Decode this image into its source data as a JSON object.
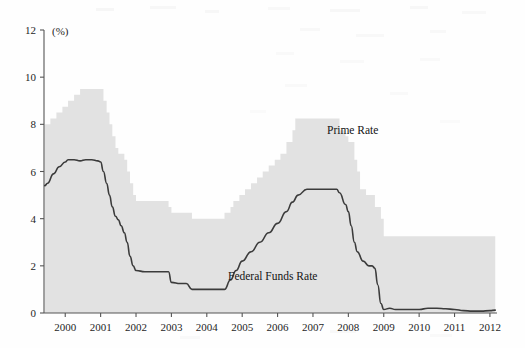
{
  "figure": {
    "background_color": "#fefefe",
    "area_fill_color": "#e2e2e2",
    "line_color": "#3b3b3b",
    "axis_color": "#555555"
  },
  "axes": {
    "y_unit_label": "(%)",
    "y_ticks": [
      "0",
      "2",
      "4",
      "6",
      "8",
      "10",
      "12"
    ],
    "x_ticks": [
      "2000",
      "2001",
      "2002",
      "2003",
      "2004",
      "2005",
      "2006",
      "2007",
      "2008",
      "2009",
      "2010",
      "2011",
      "2012"
    ]
  },
  "annotations": {
    "prime_rate_label": "Prime Rate",
    "federal_funds_label": "Federal Funds Rate"
  },
  "chart_data": {
    "type": "area",
    "title": "",
    "xlabel": "",
    "ylabel": "(%)",
    "ylim": [
      0,
      12
    ],
    "xlim": [
      1999.4,
      2012.2
    ],
    "grid": false,
    "legend": "inline annotations",
    "x_tick_values": [
      2000,
      2001,
      2002,
      2003,
      2004,
      2005,
      2006,
      2007,
      2008,
      2009,
      2010,
      2011,
      2012
    ],
    "y_tick_values": [
      0,
      2,
      4,
      6,
      8,
      10,
      12
    ],
    "series": [
      {
        "name": "Prime Rate",
        "render": "area",
        "x": [
          1999.42,
          1999.58,
          1999.75,
          1999.92,
          2000.08,
          2000.25,
          2000.42,
          2000.5,
          2000.75,
          2001.0,
          2001.08,
          2001.17,
          2001.25,
          2001.33,
          2001.42,
          2001.5,
          2001.67,
          2001.75,
          2001.83,
          2001.92,
          2002.0,
          2002.5,
          2002.92,
          2003.0,
          2003.5,
          2003.58,
          2004.0,
          2004.5,
          2004.67,
          2004.75,
          2004.92,
          2005.08,
          2005.25,
          2005.42,
          2005.58,
          2005.75,
          2005.92,
          2006.08,
          2006.25,
          2006.42,
          2006.5,
          2007.0,
          2007.58,
          2007.75,
          2007.92,
          2008.0,
          2008.17,
          2008.25,
          2008.33,
          2008.5,
          2008.75,
          2008.92,
          2009.0,
          2010.0,
          2011.0,
          2012.0,
          2012.15
        ],
        "y": [
          8.0,
          8.25,
          8.5,
          8.75,
          9.0,
          9.25,
          9.5,
          9.5,
          9.5,
          9.5,
          9.0,
          8.5,
          8.0,
          7.5,
          7.0,
          6.75,
          6.5,
          6.0,
          5.5,
          5.0,
          4.75,
          4.75,
          4.5,
          4.25,
          4.25,
          4.0,
          4.0,
          4.25,
          4.5,
          4.75,
          5.0,
          5.25,
          5.5,
          5.75,
          6.0,
          6.25,
          6.5,
          6.75,
          7.25,
          7.75,
          8.25,
          8.25,
          8.25,
          7.75,
          7.5,
          7.25,
          6.5,
          6.0,
          5.25,
          5.0,
          4.5,
          4.0,
          3.25,
          3.25,
          3.25,
          3.25,
          3.25
        ],
        "note": "Shaded grey area from 0 to the prime rate value; peaks at 9.5 in 2000-2001, troughs at 4.0 in 2003-2004, peaks again at 8.25 in 2006-2007, falls to 3.25 from 2009 onward"
      },
      {
        "name": "Federal Funds Rate",
        "render": "line",
        "x": [
          1999.42,
          1999.5,
          1999.67,
          1999.83,
          2000.0,
          2000.08,
          2000.25,
          2000.42,
          2000.58,
          2000.75,
          2000.92,
          2001.0,
          2001.08,
          2001.17,
          2001.25,
          2001.33,
          2001.42,
          2001.5,
          2001.58,
          2001.67,
          2001.75,
          2001.83,
          2001.92,
          2002.0,
          2002.25,
          2002.33,
          2002.42,
          2002.58,
          2002.75,
          2002.92,
          2003.0,
          2003.25,
          2003.42,
          2003.58,
          2003.75,
          2004.0,
          2004.25,
          2004.5,
          2004.67,
          2004.83,
          2005.0,
          2005.25,
          2005.5,
          2005.75,
          2006.0,
          2006.25,
          2006.42,
          2006.58,
          2006.83,
          2007.0,
          2007.25,
          2007.5,
          2007.67,
          2007.75,
          2007.92,
          2008.0,
          2008.08,
          2008.17,
          2008.25,
          2008.42,
          2008.58,
          2008.67,
          2008.75,
          2008.83,
          2008.92,
          2009.0,
          2009.17,
          2009.33,
          2009.5,
          2009.75,
          2010.0,
          2010.25,
          2010.5,
          2010.75,
          2011.0,
          2011.25,
          2011.5,
          2011.75,
          2012.0,
          2012.15
        ],
        "y": [
          5.4,
          5.5,
          5.9,
          6.2,
          6.4,
          6.5,
          6.5,
          6.45,
          6.5,
          6.5,
          6.45,
          6.4,
          6.0,
          5.5,
          5.0,
          4.5,
          4.1,
          3.95,
          3.7,
          3.4,
          3.0,
          2.4,
          2.0,
          1.8,
          1.75,
          1.75,
          1.75,
          1.75,
          1.75,
          1.75,
          1.3,
          1.25,
          1.25,
          1.0,
          1.0,
          1.0,
          1.0,
          1.0,
          1.4,
          1.8,
          2.2,
          2.6,
          3.0,
          3.4,
          3.8,
          4.3,
          4.7,
          5.0,
          5.25,
          5.25,
          5.25,
          5.25,
          5.25,
          5.1,
          4.6,
          4.3,
          3.7,
          3.0,
          2.6,
          2.2,
          2.0,
          2.0,
          1.9,
          1.2,
          0.4,
          0.15,
          0.2,
          0.15,
          0.15,
          0.15,
          0.15,
          0.2,
          0.2,
          0.18,
          0.15,
          0.1,
          0.08,
          0.08,
          0.1,
          0.12
        ],
        "note": "Dark grey line; starts 5.4 in mid-1999, peaks 6.5 in 2000, falls to 1.0 in 2003-2004, rises to 5.25 in 2006-2007, collapses to near 0.15 from 2009 onward"
      }
    ]
  }
}
